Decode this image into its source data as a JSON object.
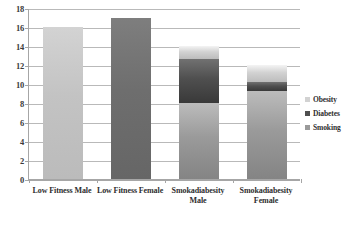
{
  "chart_data": {
    "type": "bar",
    "subtype": "stacked-bar",
    "title": "",
    "xlabel": "",
    "ylabel": "",
    "ylim": [
      0,
      18
    ],
    "ytick_step": 2,
    "yticks": [
      0,
      2,
      4,
      6,
      8,
      10,
      12,
      14,
      16,
      18
    ],
    "ytick_labels": [
      "0",
      "2",
      "4",
      "6",
      "8",
      "10",
      "12",
      "14",
      "16",
      "18"
    ],
    "grid": true,
    "grid_axis": "y",
    "legend_position": "right",
    "categories": [
      "Low Fitness Male",
      "Low Fitness Female",
      "Smokadiabesity Male",
      "Smokadiabesity Female"
    ],
    "series": [
      {
        "name": "Smoking",
        "values": [
          16,
          17,
          8,
          9.3
        ],
        "color": "#9a9a9a"
      },
      {
        "name": "Diabetes",
        "values": [
          0,
          0,
          4.6,
          0.9
        ],
        "color": "#4f4f4f"
      },
      {
        "name": "Obesity",
        "values": [
          0,
          0,
          1.4,
          1.8
        ],
        "color": "#d2d2d2"
      }
    ],
    "totals": [
      16,
      17,
      14,
      12
    ],
    "bar_colors": [
      "#c3c3c3",
      "#6e6e6e",
      "",
      ""
    ]
  },
  "legend": {
    "items": [
      {
        "label": "Obesity",
        "color": "#d2d2d2"
      },
      {
        "label": "Diabetes",
        "color": "#4f4f4f"
      },
      {
        "label": "Smoking",
        "color": "#9a9a9a"
      }
    ]
  },
  "axis": {
    "y_labels": [
      "18",
      "16",
      "14",
      "12",
      "10",
      "8",
      "6",
      "4",
      "2",
      "0"
    ],
    "x_labels": [
      "Low Fitness Male",
      "Low Fitness Female",
      "Smokadiabesity Male",
      "Smokadiabesity Female"
    ]
  },
  "colors": {
    "gridline": "#b9b9b9",
    "axis": "#a6a6a6",
    "text": "#2e2e2e",
    "background": "#ffffff"
  }
}
